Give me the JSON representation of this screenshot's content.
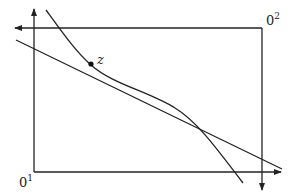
{
  "diagram": {
    "type": "edgeworth-box",
    "origins": {
      "bottom_left": {
        "base": "0",
        "sup": "1"
      },
      "top_right": {
        "base": "0",
        "sup": "2"
      }
    },
    "point_label": "z",
    "elements": [
      "axis-consumer-1-vertical",
      "axis-consumer-1-horizontal",
      "axis-consumer-2-vertical",
      "axis-consumer-2-horizontal",
      "budget-line",
      "indifference-curve",
      "point-z"
    ],
    "colors": {
      "stroke": "#222222",
      "background": "#ffffff"
    }
  }
}
